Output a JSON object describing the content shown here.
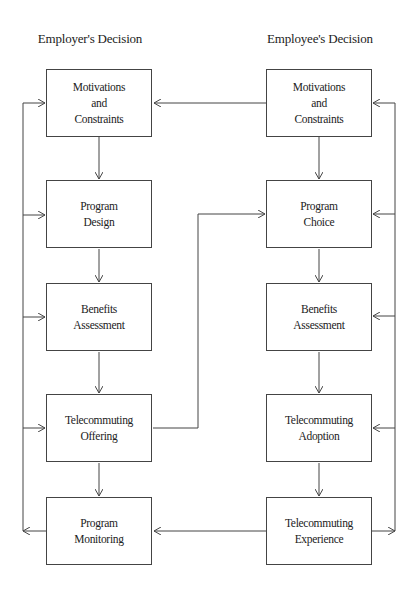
{
  "diagram": {
    "columns": {
      "employer": {
        "title": "Employer's Decision"
      },
      "employee": {
        "title": "Employee's Decision"
      }
    },
    "employer_boxes": [
      {
        "id": "emp-motivations",
        "label": "Motivations\nand\nConstraints"
      },
      {
        "id": "emp-program-design",
        "label": "Program\nDesign"
      },
      {
        "id": "emp-benefits",
        "label": "Benefits\nAssessment"
      },
      {
        "id": "emp-offering",
        "label": "Telecommuting\nOffering"
      },
      {
        "id": "emp-monitoring",
        "label": "Program\nMonitoring"
      }
    ],
    "employee_boxes": [
      {
        "id": "ee-motivations",
        "label": "Motivations\nand\nConstraints"
      },
      {
        "id": "ee-program-choice",
        "label": "Program\nChoice"
      },
      {
        "id": "ee-benefits",
        "label": "Benefits\nAssessment"
      },
      {
        "id": "ee-adoption",
        "label": "Telecommuting\nAdoption"
      },
      {
        "id": "ee-experience",
        "label": "Telecommuting\nExperience"
      }
    ],
    "edges": [
      {
        "from": "emp-motivations",
        "to": "emp-program-design"
      },
      {
        "from": "emp-program-design",
        "to": "emp-benefits"
      },
      {
        "from": "emp-benefits",
        "to": "emp-offering"
      },
      {
        "from": "emp-offering",
        "to": "emp-monitoring"
      },
      {
        "from": "ee-motivations",
        "to": "emp-motivations"
      },
      {
        "from": "ee-motivations",
        "to": "ee-program-choice"
      },
      {
        "from": "ee-program-choice",
        "to": "ee-benefits"
      },
      {
        "from": "ee-benefits",
        "to": "ee-adoption"
      },
      {
        "from": "ee-adoption",
        "to": "ee-experience"
      },
      {
        "from": "emp-offering",
        "to": "ee-program-choice"
      },
      {
        "from": "ee-experience",
        "to": "emp-monitoring"
      },
      {
        "from": "emp-monitoring",
        "to": "employer-feedback-loop",
        "note": "feeds back to all employer boxes"
      },
      {
        "from": "ee-experience",
        "to": "employee-feedback-loop",
        "note": "feeds back to all employee boxes"
      }
    ],
    "line_color": "#444444"
  }
}
